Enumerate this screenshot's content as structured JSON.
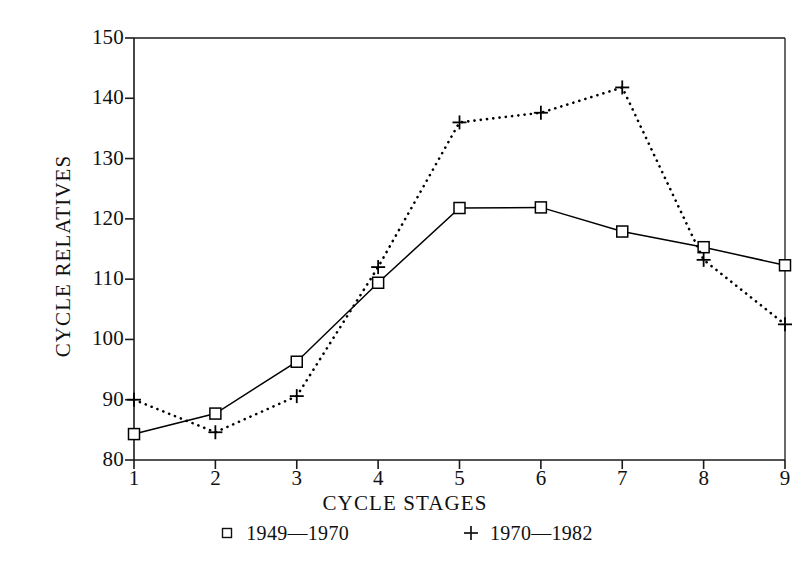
{
  "chart_data": {
    "type": "line",
    "title": "",
    "xlabel": "CYCLE STAGES",
    "ylabel": "CYCLE RELATIVES",
    "x": [
      1,
      2,
      3,
      4,
      5,
      6,
      7,
      8,
      9
    ],
    "categories": [
      "1",
      "2",
      "3",
      "4",
      "5",
      "6",
      "7",
      "8",
      "9"
    ],
    "xlim": [
      1,
      9
    ],
    "ylim": [
      80,
      150
    ],
    "ytick_labels": [
      "150",
      "140",
      "130",
      "120",
      "110",
      "100",
      "90",
      "80"
    ],
    "ytick_values": [
      150,
      140,
      130,
      120,
      110,
      100,
      90,
      80
    ],
    "grid": false,
    "legend_position": "below-axis",
    "series": [
      {
        "name": "1949—1970",
        "marker": "square",
        "linestyle": "solid",
        "color": "#000000",
        "values": [
          84.3,
          87.7,
          96.3,
          109.4,
          121.8,
          121.9,
          117.9,
          115.3,
          112.3
        ]
      },
      {
        "name": "1970—1982",
        "marker": "plus",
        "linestyle": "dotted",
        "color": "#000000",
        "values": [
          90.0,
          84.6,
          90.6,
          112.0,
          136.0,
          137.6,
          141.8,
          113.2,
          102.5
        ]
      }
    ]
  },
  "axes": {
    "y_title": "CYCLE RELATIVES",
    "x_title": "CYCLE STAGES"
  },
  "legend": {
    "entries": [
      {
        "marker": "square-marker",
        "label": "1949—1970"
      },
      {
        "marker": "plus-marker",
        "label": "1970—1982"
      }
    ]
  },
  "colors": {
    "ink": "#111111",
    "axis": "#1a1a1a",
    "series1": "#000000",
    "series2": "#000000",
    "background": "#ffffff"
  }
}
